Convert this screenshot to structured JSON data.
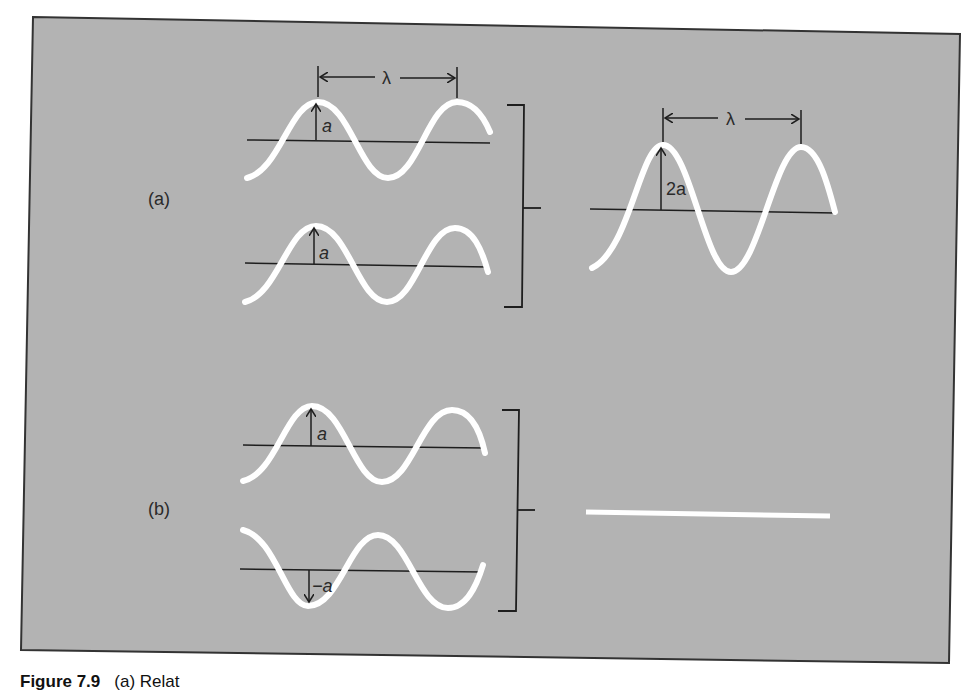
{
  "figure": {
    "panel_color": "#b3b3b3",
    "wave_color": "#ffffff",
    "line_color": "#1e1e1e",
    "panels": {
      "a": {
        "label": "(a)",
        "wave1": {
          "amplitude_label": "a",
          "wavelength_label": "λ"
        },
        "wave2": {
          "amplitude_label": "a"
        },
        "result": {
          "amplitude_label": "2a",
          "wavelength_label": "λ",
          "description": "Constructive interference: waves in phase add to amplitude 2a"
        }
      },
      "b": {
        "label": "(b)",
        "wave1": {
          "amplitude_label": "a"
        },
        "wave2": {
          "amplitude_label": "−a"
        },
        "result": {
          "description": "Destructive interference: waves out of phase cancel to flat line"
        }
      }
    }
  },
  "caption": {
    "figure_number": "Figure 7.9",
    "text": "(a) Relat"
  }
}
